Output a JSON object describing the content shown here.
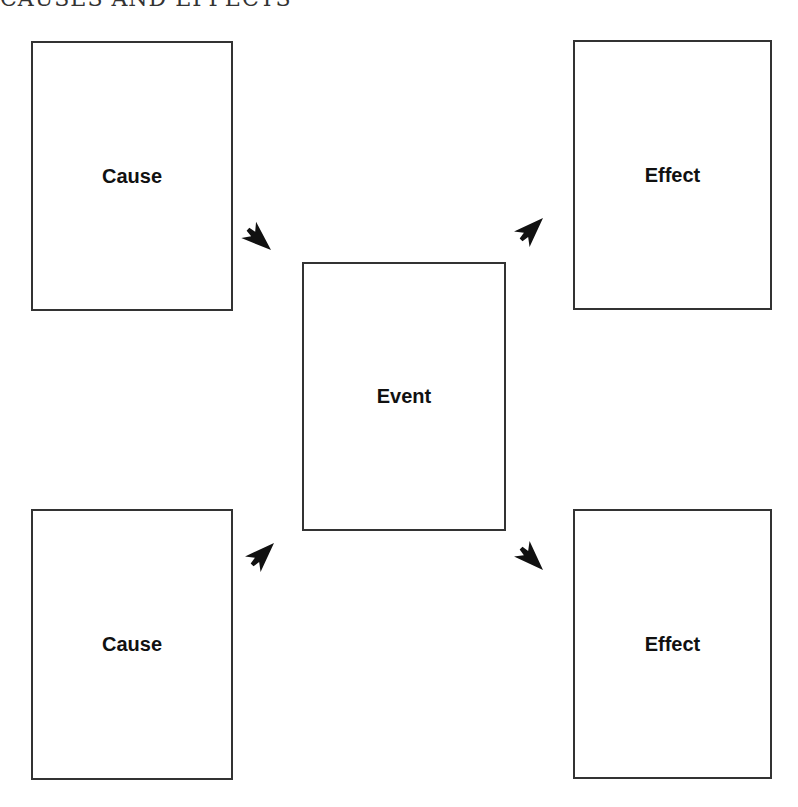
{
  "title": "CAUSES AND EFFECTS",
  "boxes": {
    "cause_top": {
      "label": "Cause"
    },
    "cause_bottom": {
      "label": "Cause"
    },
    "event": {
      "label": "Event"
    },
    "effect_top": {
      "label": "Effect"
    },
    "effect_bottom": {
      "label": "Effect"
    }
  },
  "arrows": [
    {
      "name": "cause-top-to-event",
      "direction": "down-right"
    },
    {
      "name": "cause-bottom-to-event",
      "direction": "up-right"
    },
    {
      "name": "event-to-effect-top",
      "direction": "up-right"
    },
    {
      "name": "event-to-effect-bottom",
      "direction": "down-right"
    }
  ],
  "colors": {
    "border": "#333333",
    "arrow": "#111111",
    "background": "#ffffff"
  }
}
